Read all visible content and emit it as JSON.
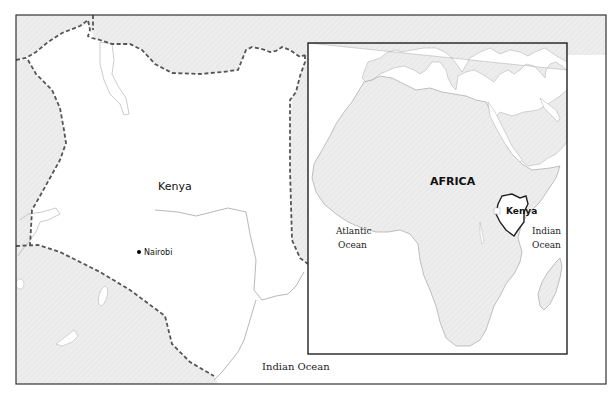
{
  "main_map": {
    "country_label": "Kenya",
    "city_label": "Nairobi",
    "ocean_label": "Indian Ocean"
  },
  "inset_map": {
    "continent_label": "AFRICA",
    "country_label": "Kenya",
    "ocean_left_line1": "Atlantic",
    "ocean_left_line2": "Ocean",
    "ocean_right_line1": "Indian",
    "ocean_right_line2": "Ocean"
  },
  "colors": {
    "land_neighbor": "#ececec",
    "land_highlight": "#ffffff",
    "water": "#ffffff",
    "border_dashed": "#555555",
    "frame": "#333333",
    "coastline": "#aaaaaa"
  }
}
